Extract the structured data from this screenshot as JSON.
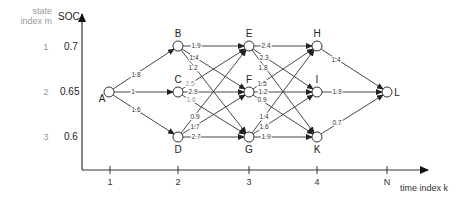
{
  "y_axis": {
    "title": "SOC",
    "state_index_header_line1": "state",
    "state_index_header_line2": "index m",
    "rows": [
      {
        "index": "1",
        "soc": "0.7"
      },
      {
        "index": "2",
        "soc": "0.65"
      },
      {
        "index": "3",
        "soc": "0.6"
      }
    ]
  },
  "x_axis": {
    "title": "time index k",
    "ticks": [
      "1",
      "2",
      "3",
      "4",
      "N"
    ]
  },
  "nodes": [
    {
      "id": "A",
      "stage": "1",
      "state": "2"
    },
    {
      "id": "B",
      "stage": "2",
      "state": "1"
    },
    {
      "id": "C",
      "stage": "2",
      "state": "2"
    },
    {
      "id": "D",
      "stage": "2",
      "state": "3"
    },
    {
      "id": "E",
      "stage": "3",
      "state": "1"
    },
    {
      "id": "F",
      "stage": "3",
      "state": "2"
    },
    {
      "id": "G",
      "stage": "3",
      "state": "3"
    },
    {
      "id": "H",
      "stage": "4",
      "state": "1"
    },
    {
      "id": "I",
      "stage": "4",
      "state": "2"
    },
    {
      "id": "K",
      "stage": "4",
      "state": "3"
    },
    {
      "id": "L",
      "stage": "N",
      "state": "2"
    }
  ],
  "edges": [
    {
      "from": "A",
      "to": "B",
      "cost": "1.8"
    },
    {
      "from": "A",
      "to": "C",
      "cost": "1"
    },
    {
      "from": "A",
      "to": "D",
      "cost": "1.6"
    },
    {
      "from": "B",
      "to": "E",
      "cost": "1.9"
    },
    {
      "from": "B",
      "to": "F",
      "cost": "1.4"
    },
    {
      "from": "B",
      "to": "G",
      "cost": "1.2"
    },
    {
      "from": "C",
      "to": "E",
      "cost": "2.5"
    },
    {
      "from": "C",
      "to": "F",
      "cost": "2.9"
    },
    {
      "from": "C",
      "to": "G",
      "cost": "1.6"
    },
    {
      "from": "D",
      "to": "E",
      "cost": "0.9"
    },
    {
      "from": "D",
      "to": "F",
      "cost": "1.7"
    },
    {
      "from": "D",
      "to": "G",
      "cost": "2.7"
    },
    {
      "from": "E",
      "to": "H",
      "cost": "2.4"
    },
    {
      "from": "E",
      "to": "I",
      "cost": "2.3"
    },
    {
      "from": "E",
      "to": "K",
      "cost": "1.8"
    },
    {
      "from": "F",
      "to": "H",
      "cost": "1.5"
    },
    {
      "from": "F",
      "to": "I",
      "cost": "1.2"
    },
    {
      "from": "F",
      "to": "K",
      "cost": "0.9"
    },
    {
      "from": "G",
      "to": "H",
      "cost": "1.4"
    },
    {
      "from": "G",
      "to": "I",
      "cost": "1.6"
    },
    {
      "from": "G",
      "to": "K",
      "cost": "1.9"
    },
    {
      "from": "H",
      "to": "L",
      "cost": "1.4"
    },
    {
      "from": "I",
      "to": "L",
      "cost": "1.9"
    },
    {
      "from": "K",
      "to": "L",
      "cost": "0.7"
    }
  ]
}
